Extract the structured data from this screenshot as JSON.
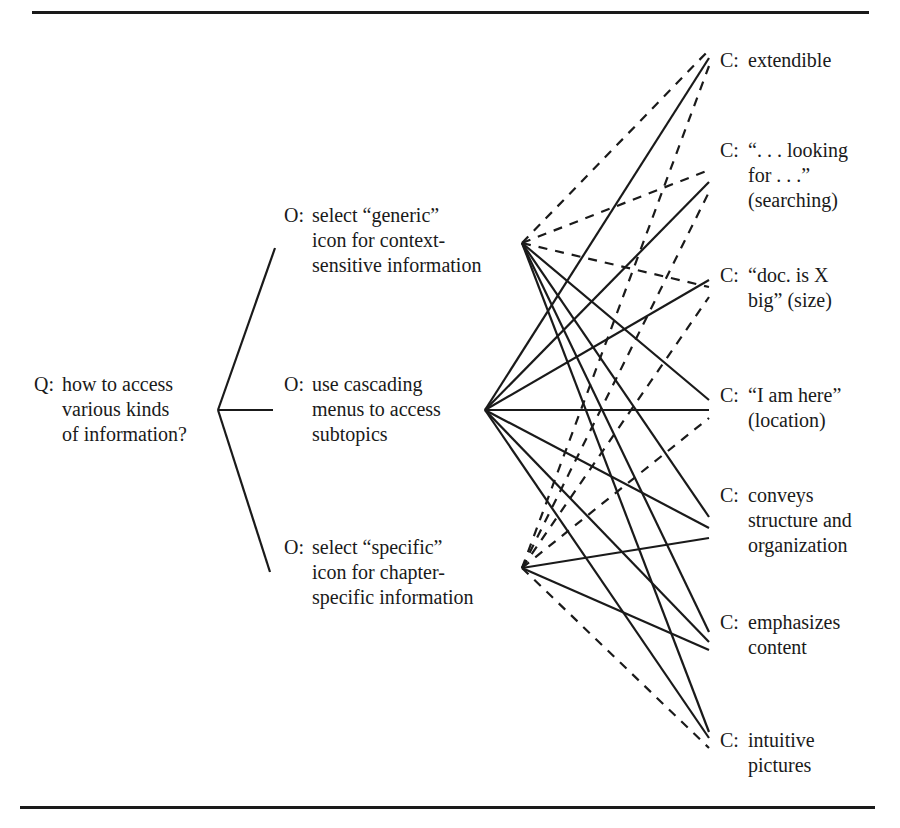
{
  "question": {
    "prefix": "Q:",
    "lines": [
      "how to access",
      "various kinds",
      "of information?"
    ]
  },
  "options": [
    {
      "id": "generic",
      "prefix": "O:",
      "lines": [
        "select “generic”",
        "icon for context-",
        "sensitive information"
      ]
    },
    {
      "id": "cascading",
      "prefix": "O:",
      "lines": [
        "use cascading",
        "menus to access",
        "subtopics"
      ]
    },
    {
      "id": "specific",
      "prefix": "O:",
      "lines": [
        "select “specific”",
        "icon for chapter-",
        "specific information"
      ]
    }
  ],
  "criteria": [
    {
      "id": "extendible",
      "prefix": "C:",
      "lines": [
        "extendible"
      ]
    },
    {
      "id": "searching",
      "prefix": "C:",
      "lines": [
        "“. . . looking",
        "for . . .”",
        "(searching)"
      ]
    },
    {
      "id": "size",
      "prefix": "C:",
      "lines": [
        "“doc. is X",
        "big” (size)"
      ]
    },
    {
      "id": "location",
      "prefix": "C:",
      "lines": [
        "“I am here”",
        "(location)"
      ]
    },
    {
      "id": "structure",
      "prefix": "C:",
      "lines": [
        "conveys",
        "structure and",
        "organization"
      ]
    },
    {
      "id": "emphasis",
      "prefix": "C:",
      "lines": [
        "emphasizes",
        "content"
      ]
    },
    {
      "id": "intuitive",
      "prefix": "C:",
      "lines": [
        "intuitive",
        "pictures"
      ]
    }
  ],
  "links": [
    {
      "from": "generic",
      "to": "extendible",
      "style": "dashed"
    },
    {
      "from": "generic",
      "to": "searching",
      "style": "dashed"
    },
    {
      "from": "generic",
      "to": "size",
      "style": "dashed"
    },
    {
      "from": "generic",
      "to": "location",
      "style": "solid"
    },
    {
      "from": "generic",
      "to": "structure",
      "style": "solid"
    },
    {
      "from": "generic",
      "to": "emphasis",
      "style": "solid"
    },
    {
      "from": "generic",
      "to": "intuitive",
      "style": "solid"
    },
    {
      "from": "cascading",
      "to": "extendible",
      "style": "solid"
    },
    {
      "from": "cascading",
      "to": "searching",
      "style": "solid"
    },
    {
      "from": "cascading",
      "to": "size",
      "style": "solid"
    },
    {
      "from": "cascading",
      "to": "location",
      "style": "solid"
    },
    {
      "from": "cascading",
      "to": "structure",
      "style": "solid"
    },
    {
      "from": "cascading",
      "to": "emphasis",
      "style": "solid"
    },
    {
      "from": "cascading",
      "to": "intuitive",
      "style": "solid"
    },
    {
      "from": "specific",
      "to": "extendible",
      "style": "dashed"
    },
    {
      "from": "specific",
      "to": "searching",
      "style": "dashed"
    },
    {
      "from": "specific",
      "to": "size",
      "style": "dashed"
    },
    {
      "from": "specific",
      "to": "location",
      "style": "dashed"
    },
    {
      "from": "specific",
      "to": "structure",
      "style": "solid"
    },
    {
      "from": "specific",
      "to": "emphasis",
      "style": "solid"
    },
    {
      "from": "specific",
      "to": "intuitive",
      "style": "dashed"
    }
  ],
  "legend_meaning": {
    "solid": "supports",
    "dashed": "objects to"
  }
}
